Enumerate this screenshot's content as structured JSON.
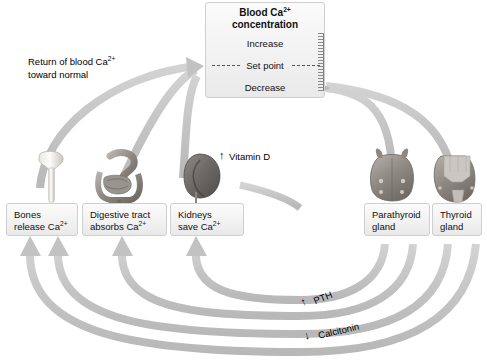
{
  "diagram": {
    "title_box": {
      "name": "blood-calcium-concentration",
      "title_line1": "Blood Ca",
      "title_sup": "2+",
      "title_line2": "concentration",
      "levels": {
        "increase": "Increase",
        "set_point": "Set point",
        "decrease": "Decrease"
      }
    },
    "effector_boxes": [
      {
        "id": "bones",
        "line1": "Bones",
        "line2": "release Ca",
        "sup": "2+"
      },
      {
        "id": "digestive",
        "line1": "Digestive tract",
        "line2": "absorbs Ca",
        "sup": "2+"
      },
      {
        "id": "kidneys",
        "line1": "Kidneys",
        "line2": "save Ca",
        "sup": "2+"
      }
    ],
    "gland_boxes": [
      {
        "id": "parathyroid",
        "line1": "Parathyroid",
        "line2": "gland"
      },
      {
        "id": "thyroid",
        "line1": "Thyroid",
        "line2": "gland"
      }
    ],
    "annotations": {
      "return_line1": "Return of blood Ca",
      "return_sup": "2+",
      "return_line2": "toward normal",
      "vitamin_d": "Vitamin D",
      "vitamin_d_arrow": "↑",
      "pth": "PTH",
      "pth_arrow": "↑",
      "calcitonin": "Calcitonin",
      "calcitonin_arrow": "↓"
    },
    "organ_illustrations": [
      {
        "id": "femur-bone",
        "label": "bone"
      },
      {
        "id": "digestive-tract",
        "label": "digestive tract"
      },
      {
        "id": "kidney",
        "label": "kidney"
      },
      {
        "id": "parathyroid-gland-illustration",
        "label": "parathyroid gland"
      },
      {
        "id": "thyroid-gland-illustration",
        "label": "thyroid gland"
      }
    ],
    "colors": {
      "arrow": "#c6c6c6",
      "arrow_dark": "#b4b4b4",
      "box_border": "#cfcfcf",
      "box_fill": "#f2f2f2",
      "text": "#111111",
      "dash": "#555555"
    }
  }
}
